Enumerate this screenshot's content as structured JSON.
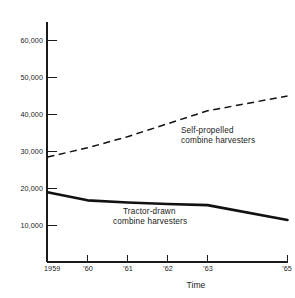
{
  "chart_data": {
    "type": "line",
    "title": "",
    "subtitle": "",
    "xlabel": "Time",
    "ylabel": "",
    "grid": false,
    "legend_position": "inline-annotation",
    "x": [
      1959,
      1960,
      1961,
      1962,
      1963,
      1965
    ],
    "xtick_labels": [
      "1959",
      "'60",
      "'61",
      "'62",
      "'63",
      "'65"
    ],
    "xlim": [
      1959,
      1965
    ],
    "ylim": [
      0,
      65000
    ],
    "ytick_values": [
      10000,
      20000,
      30000,
      40000,
      50000,
      60000
    ],
    "ytick_labels": [
      "10,000",
      "20,000",
      "30,000",
      "40,000",
      "50,000",
      "60,000"
    ],
    "series": [
      {
        "name": "Self-propelled combine harvesters",
        "style": "dashed",
        "values": [
          28500,
          31000,
          34000,
          37500,
          41000,
          45000
        ]
      },
      {
        "name": "Tractor-drawn combine harvesters",
        "style": "solid",
        "values": [
          19000,
          16800,
          16200,
          15800,
          15500,
          11500
        ]
      }
    ],
    "annotations": [
      {
        "id": "self-propelled",
        "line1": "Self-propelled",
        "line2": "combine harvesters"
      },
      {
        "id": "tractor-drawn",
        "line1": "Tractor-drawn",
        "line2": "combine harvesters"
      }
    ]
  },
  "colors": {
    "ink": "#111111",
    "axis": "#1a1a1a",
    "background": "#ffffff"
  }
}
